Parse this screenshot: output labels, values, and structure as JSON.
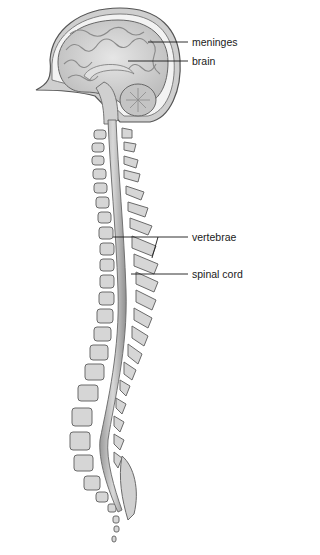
{
  "diagram": {
    "labels": [
      {
        "id": "meninges",
        "text": "meninges"
      },
      {
        "id": "brain",
        "text": "brain"
      },
      {
        "id": "vertebrae",
        "text": "vertebrae"
      },
      {
        "id": "spinal_cord",
        "text": "spinal cord"
      }
    ],
    "colors": {
      "outline": "#555555",
      "fill_light": "#d9d9d9",
      "fill_mid": "#bdbdbd",
      "fill_dark": "#8a8a8a",
      "leader": "#1a1a1a"
    }
  }
}
